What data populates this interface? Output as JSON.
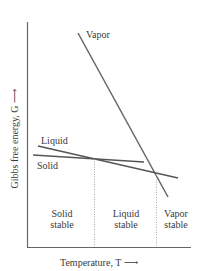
{
  "diagram": {
    "y_axis_label": "Gibbs free energy, G ⟶",
    "x_axis_label": "Temperature, T ⟶",
    "curves": [
      {
        "name": "Vapor",
        "label": "Vapor"
      },
      {
        "name": "Liquid",
        "label": "Liquid"
      },
      {
        "name": "Solid",
        "label": "Solid"
      }
    ],
    "regions": [
      {
        "line1": "Solid",
        "line2": "stable"
      },
      {
        "line1": "Liquid",
        "line2": "stable"
      },
      {
        "line1": "Vapor",
        "line2": "stable"
      }
    ],
    "colors": {
      "lines": "#555555",
      "axes": "#555555",
      "dotted": "#999999"
    }
  }
}
